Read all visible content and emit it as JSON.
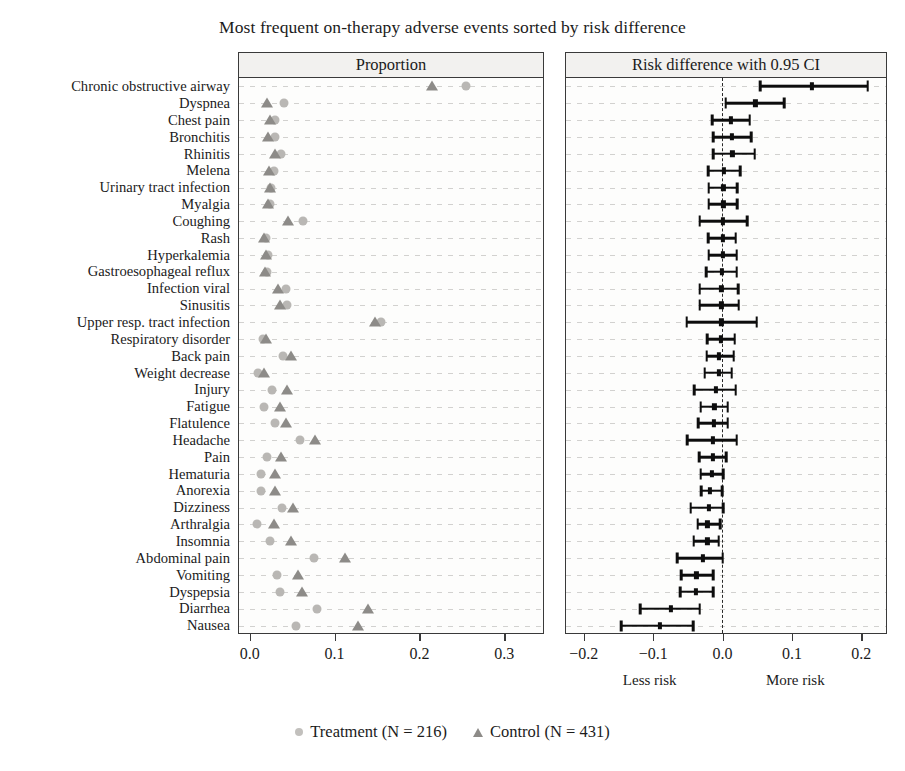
{
  "chart_data": {
    "type": "scatter",
    "title": "Most frequent on-therapy adverse events sorted by risk difference",
    "panels": [
      {
        "name": "proportion",
        "header": "Proportion",
        "xlabel": "",
        "xlim": [
          -0.012,
          0.345
        ],
        "ticks": [
          0.0,
          0.1,
          0.2,
          0.3
        ],
        "ticklabels": [
          "0.0",
          "0.1",
          "0.2",
          "0.3"
        ],
        "grid": "row-dotted",
        "series": [
          {
            "name": "Treatment (N = 216)",
            "marker": "circle",
            "color": "#b9b7b4"
          },
          {
            "name": "Control (N = 431)",
            "marker": "triangle",
            "color": "#8d8b88"
          }
        ]
      },
      {
        "name": "risk-difference",
        "header": "Risk difference with 0.95 CI",
        "xlabel": "",
        "xlim": [
          -0.225,
          0.235
        ],
        "ticks": [
          -0.2,
          -0.1,
          0.0,
          0.1,
          0.2
        ],
        "ticklabels": [
          "−0.2",
          "−0.1",
          "0.0",
          "0.1",
          "0.2"
        ],
        "reference_line": 0.0,
        "left_note": "Less risk",
        "right_note": "More risk"
      }
    ],
    "categories": [
      "Chronic obstructive airway",
      "Dyspnea",
      "Chest pain",
      "Bronchitis",
      "Rhinitis",
      "Melena",
      "Urinary tract infection",
      "Myalgia",
      "Coughing",
      "Rash",
      "Hyperkalemia",
      "Gastroesophageal reflux",
      "Infection viral",
      "Sinusitis",
      "Upper resp. tract infection",
      "Respiratory disorder",
      "Back pain",
      "Weight decrease",
      "Injury",
      "Fatigue",
      "Flatulence",
      "Headache",
      "Pain",
      "Hematuria",
      "Anorexia",
      "Dizziness",
      "Arthralgia",
      "Insomnia",
      "Abdominal pain",
      "Vomiting",
      "Dyspepsia",
      "Diarrhea",
      "Nausea"
    ],
    "treatment_proportion": [
      0.255,
      0.041,
      0.031,
      0.03,
      0.037,
      0.029,
      0.026,
      0.024,
      0.063,
      0.02,
      0.022,
      0.021,
      0.043,
      0.045,
      0.155,
      0.016,
      0.04,
      0.01,
      0.027,
      0.018,
      0.03,
      0.06,
      0.021,
      0.014,
      0.014,
      0.039,
      0.009,
      0.025,
      0.076,
      0.033,
      0.036,
      0.08,
      0.055
    ],
    "control_proportion": [
      0.215,
      0.021,
      0.024,
      0.022,
      0.03,
      0.023,
      0.024,
      0.022,
      0.046,
      0.018,
      0.02,
      0.019,
      0.034,
      0.036,
      0.148,
      0.02,
      0.049,
      0.018,
      0.044,
      0.036,
      0.043,
      0.077,
      0.037,
      0.031,
      0.031,
      0.052,
      0.029,
      0.049,
      0.113,
      0.057,
      0.062,
      0.14,
      0.128
    ],
    "risk_difference": [
      0.13,
      0.048,
      0.013,
      0.014,
      0.015,
      0.003,
      0.002,
      0.002,
      0.001,
      0.001,
      0.001,
      0.0,
      -0.001,
      -0.001,
      -0.001,
      -0.002,
      -0.004,
      -0.005,
      -0.009,
      -0.011,
      -0.012,
      -0.013,
      -0.013,
      -0.015,
      -0.017,
      -0.019,
      -0.021,
      -0.021,
      -0.027,
      -0.037,
      -0.038,
      -0.074,
      -0.09
    ],
    "ci_lower": [
      0.055,
      0.005,
      -0.014,
      -0.013,
      -0.013,
      -0.02,
      -0.019,
      -0.019,
      -0.032,
      -0.02,
      -0.019,
      -0.023,
      -0.032,
      -0.032,
      -0.051,
      -0.021,
      -0.022,
      -0.025,
      -0.04,
      -0.031,
      -0.034,
      -0.05,
      -0.033,
      -0.031,
      -0.03,
      -0.045,
      -0.035,
      -0.041,
      -0.065,
      -0.059,
      -0.06,
      -0.118,
      -0.145
    ],
    "ci_upper": [
      0.21,
      0.09,
      0.04,
      0.042,
      0.047,
      0.026,
      0.022,
      0.022,
      0.036,
      0.02,
      0.021,
      0.021,
      0.023,
      0.024,
      0.05,
      0.018,
      0.017,
      0.014,
      0.02,
      0.008,
      0.008,
      0.021,
      0.006,
      0.002,
      0.0,
      0.002,
      -0.003,
      -0.005,
      0.001,
      -0.013,
      -0.013,
      -0.032,
      -0.042
    ],
    "legend": [
      {
        "label": "Treatment (N = 216)",
        "marker": "circle"
      },
      {
        "label": "Control (N = 431)",
        "marker": "triangle"
      }
    ]
  }
}
